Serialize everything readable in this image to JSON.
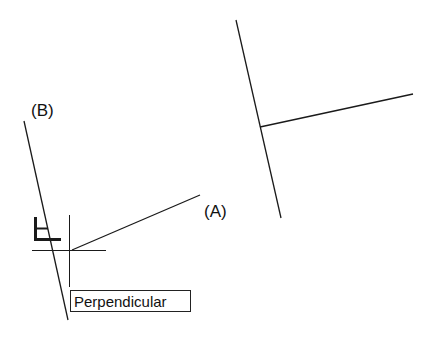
{
  "labels": {
    "line_a": "(A)",
    "line_b": "(B)"
  },
  "tooltip": {
    "text": "Perpendicular"
  },
  "icons": {
    "snap_marker": "perpendicular-snap-icon",
    "cursor": "crosshair-cursor-icon"
  },
  "colors": {
    "line": "#1a1a1a",
    "background": "#ffffff"
  }
}
